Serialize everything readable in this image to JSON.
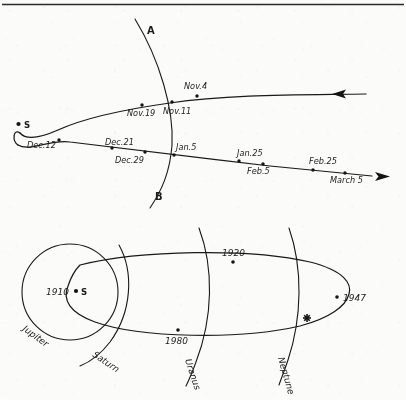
{
  "figure": {
    "background_color": "#fbfbfa",
    "ink_color": "#191919"
  },
  "top_panel": {
    "name": "comet-perihelion-passage",
    "sun_label": "S",
    "arc_label_top": "A",
    "arc_label_bottom": "B",
    "incoming_arrow_direction": "left",
    "outgoing_arrow_direction": "right",
    "date_markers": [
      {
        "label": "Nov.4",
        "branch": "incoming",
        "x": 197,
        "y": 96,
        "label_x": 184,
        "label_y": 89
      },
      {
        "label": "Nov.11",
        "branch": "incoming",
        "x": 172,
        "y": 103,
        "label_x": 165,
        "label_y": 114
      },
      {
        "label": "Nov.19",
        "branch": "incoming",
        "x": 142,
        "y": 105,
        "label_x": 128,
        "label_y": 116
      },
      {
        "label": "Dec.12",
        "branch": "outgoing",
        "x": 59,
        "y": 140,
        "label_x": 27,
        "label_y": 148
      },
      {
        "label": "Dec.21",
        "branch": "outgoing",
        "x": 112,
        "y": 148,
        "label_x": 106,
        "label_y": 145
      },
      {
        "label": "Dec.29",
        "branch": "outgoing",
        "x": 145,
        "y": 153,
        "label_x": 116,
        "label_y": 162
      },
      {
        "label": "Jan.5",
        "branch": "outgoing",
        "x": 174,
        "y": 155,
        "label_x": 175,
        "label_y": 150
      },
      {
        "label": "Jan.25",
        "branch": "outgoing",
        "x": 239,
        "y": 162,
        "label_x": 238,
        "label_y": 157
      },
      {
        "label": "Feb.5",
        "branch": "outgoing",
        "x": 263,
        "y": 165,
        "label_x": 248,
        "label_y": 174
      },
      {
        "label": "Feb.25",
        "branch": "outgoing",
        "x": 313,
        "y": 170,
        "label_x": 310,
        "label_y": 165
      },
      {
        "label": "March 5",
        "branch": "outgoing",
        "x": 345,
        "y": 173,
        "label_x": 331,
        "label_y": 182
      }
    ]
  },
  "bottom_panel": {
    "name": "comet-long-period-orbit",
    "sun_label": "S",
    "planet_orbits": [
      {
        "label": "Jupiter",
        "shape": "circle"
      },
      {
        "label": "Saturn",
        "shape": "arc"
      },
      {
        "label": "Uranus",
        "shape": "arc"
      },
      {
        "label": "Neptune",
        "shape": "arc"
      }
    ],
    "year_markers": [
      {
        "label": "1910",
        "x": 76,
        "y": 291,
        "label_x": 46,
        "label_y": 295
      },
      {
        "label": "1920",
        "x": 233,
        "y": 263,
        "label_x": 224,
        "label_y": 256
      },
      {
        "label": "1947",
        "x": 335,
        "y": 297,
        "label_x": 343,
        "label_y": 301
      },
      {
        "label": "1980",
        "x": 178,
        "y": 331,
        "label_x": 166,
        "label_y": 343
      }
    ],
    "star_marker": {
      "name": "comet-position-star",
      "x": 307,
      "y": 318
    }
  }
}
